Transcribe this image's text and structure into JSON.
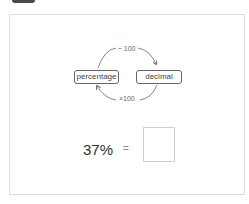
{
  "header": {
    "tab_icon": "tab-handle"
  },
  "diagram": {
    "from_label": "percentage",
    "to_label": "decimal",
    "forward_op": "÷ 100",
    "backward_op": "×100"
  },
  "question": {
    "expression": "37%",
    "equals": "=",
    "answer_value": ""
  },
  "colors": {
    "border": "#dcdcdc",
    "arrow": "#555555",
    "text": "#333333"
  }
}
